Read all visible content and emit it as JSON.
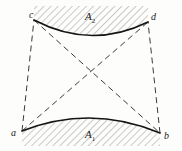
{
  "figure": {
    "type": "geometric-diagram",
    "background_color": "#fdfdfb",
    "stroke_color": "#1a1a1a",
    "dash_color": "#3a3a3a",
    "hatch_color": "#7a7a7a",
    "vertices": [
      {
        "id": "c",
        "label": "c",
        "x": 34,
        "y": 20
      },
      {
        "id": "d",
        "label": "d",
        "x": 148,
        "y": 22
      },
      {
        "id": "a",
        "label": "a",
        "x": 22,
        "y": 131
      },
      {
        "id": "b",
        "label": "b",
        "x": 160,
        "y": 133
      }
    ],
    "arcs": [
      {
        "id": "A2",
        "label": "A",
        "subscript": "2",
        "from": "c",
        "to": "d",
        "curvature": "sags-downward",
        "hatched_side": "above"
      },
      {
        "id": "A1",
        "label": "A",
        "subscript": "1",
        "from": "a",
        "to": "b",
        "curvature": "bulges-upward",
        "hatched_side": "below"
      }
    ],
    "dashed_edges": [
      {
        "from": "a",
        "to": "c"
      },
      {
        "from": "b",
        "to": "d"
      }
    ],
    "dashed_diagonals": [
      {
        "from": "a",
        "to": "d"
      },
      {
        "from": "c",
        "to": "b"
      }
    ]
  }
}
